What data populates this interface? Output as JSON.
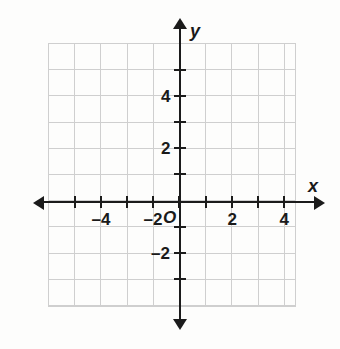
{
  "figure": {
    "type": "coordinate-plane",
    "title": "",
    "background_color": "#fdfdfc",
    "grid_color": "#cfcfcf",
    "axis_color": "#1b1b1b"
  },
  "axes": {
    "x_label": "x",
    "y_label": "y",
    "origin_label": "O",
    "x_range": [
      -5,
      5
    ],
    "y_range": [
      -5,
      5
    ],
    "grid": true,
    "grid_step": 1
  },
  "x_ticks": [
    {
      "value": -5,
      "label": "",
      "px": 75
    },
    {
      "value": -4,
      "label": "–4",
      "px": 101
    },
    {
      "value": -3,
      "label": "",
      "px": 127
    },
    {
      "value": -2,
      "label": "–2",
      "px": 153
    },
    {
      "value": -1,
      "label": "",
      "px": 179
    },
    {
      "value": 1,
      "label": "",
      "px": 206
    },
    {
      "value": 2,
      "label": "2",
      "px": 232
    },
    {
      "value": 3,
      "label": "",
      "px": 258
    },
    {
      "value": 4,
      "label": "4",
      "px": 284
    }
  ],
  "y_ticks": [
    {
      "value": 5,
      "label": "",
      "px": 70
    },
    {
      "value": 4,
      "label": "4",
      "px": 96
    },
    {
      "value": 3,
      "label": "",
      "px": 122
    },
    {
      "value": 2,
      "label": "2",
      "px": 148
    },
    {
      "value": 1,
      "label": "",
      "px": 174
    },
    {
      "value": -1,
      "label": "",
      "px": 227
    },
    {
      "value": -2,
      "label": "–2",
      "px": 253
    },
    {
      "value": -3,
      "label": "",
      "px": 279
    }
  ],
  "chart_data": {
    "type": "scatter",
    "title": "",
    "xlabel": "x",
    "ylabel": "y",
    "xlim": [
      -5.3,
      4.6
    ],
    "ylim": [
      -4.1,
      5.8
    ],
    "xticks": [
      -4,
      -2,
      2,
      4
    ],
    "yticks": [
      -2,
      2,
      4
    ],
    "xtick_labels": [
      "–4",
      "–2",
      "2",
      "4"
    ],
    "ytick_labels": [
      "–2",
      "2",
      "4"
    ],
    "grid": true,
    "grid_step": 1,
    "series": [],
    "annotations": [
      {
        "text": "O",
        "x": 0,
        "y": 0,
        "role": "origin-label"
      }
    ],
    "legend": null,
    "note": "Empty coordinate grid; no data points or curves plotted."
  }
}
